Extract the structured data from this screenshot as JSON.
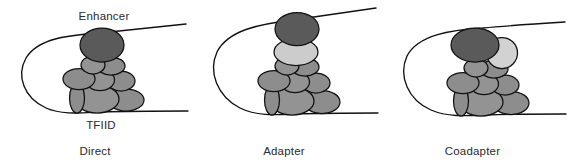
{
  "figure": {
    "background_color": "#ffffff",
    "line_color": "#111111",
    "text_color": "#2b2b2b"
  },
  "palette": {
    "activator_dark": "#5a5a5a",
    "adapter_light": "#cccccc",
    "coadapter_light": "#d2d2d2",
    "tfiid_mid": "#8d8d8d",
    "tfiid_mid_alt": "#939393",
    "outline": "#111111"
  },
  "panels": [
    {
      "id": "direct",
      "caption": "Direct",
      "labels": {
        "enhancer": "Enhancer",
        "tfiid": "TFIID"
      },
      "components": [
        {
          "name": "enhancer-dna-loop",
          "kind": "dna"
        },
        {
          "name": "activator",
          "kind": "ellipse",
          "color": "#5a5a5a"
        },
        {
          "name": "tfiid-complex",
          "kind": "cluster",
          "color": "#8d8d8d",
          "subunit_count": 8
        }
      ]
    },
    {
      "id": "adapter",
      "caption": "Adapter",
      "labels": {
        "enhancer": "",
        "tfiid": ""
      },
      "components": [
        {
          "name": "enhancer-dna-loop",
          "kind": "dna"
        },
        {
          "name": "activator",
          "kind": "ellipse",
          "color": "#5a5a5a"
        },
        {
          "name": "adapter",
          "kind": "ellipse",
          "color": "#cccccc"
        },
        {
          "name": "tfiid-complex",
          "kind": "cluster",
          "color": "#8d8d8d",
          "subunit_count": 8
        }
      ]
    },
    {
      "id": "coadapter",
      "caption": "Coadapter",
      "labels": {
        "enhancer": "",
        "tfiid": ""
      },
      "components": [
        {
          "name": "enhancer-dna-loop",
          "kind": "dna"
        },
        {
          "name": "activator",
          "kind": "ellipse",
          "color": "#5a5a5a"
        },
        {
          "name": "coadapter",
          "kind": "circle",
          "color": "#d2d2d2"
        },
        {
          "name": "tfiid-complex",
          "kind": "cluster",
          "color": "#8d8d8d",
          "subunit_count": 8
        }
      ]
    }
  ]
}
